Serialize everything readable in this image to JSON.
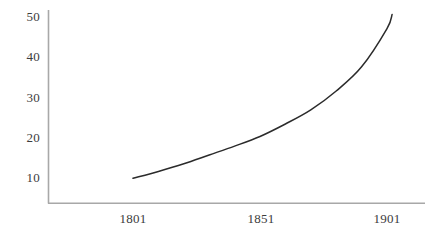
{
  "chart_data": {
    "type": "line",
    "title": "",
    "subtitle": "",
    "xlabel": "",
    "ylabel": "",
    "xlim": [
      1781,
      1920
    ],
    "ylim": [
      0,
      54
    ],
    "grid": false,
    "legend": null,
    "x_ticks": [
      "1801",
      "1851",
      "1901"
    ],
    "x_tick_values": [
      1801,
      1851,
      1901
    ],
    "y_ticks": [
      "10",
      "20",
      "30",
      "40",
      "50"
    ],
    "y_tick_values": [
      10,
      20,
      30,
      40,
      50
    ],
    "series": [
      {
        "name": "",
        "color": "#2b2b2b",
        "x": [
          1801,
          1811,
          1821,
          1831,
          1841,
          1851,
          1861,
          1871,
          1881,
          1891,
          1901,
          1903
        ],
        "values": [
          9.8,
          11.5,
          13.4,
          15.6,
          17.8,
          20.2,
          23.3,
          26.8,
          31.5,
          37.5,
          47.0,
          50.5
        ]
      }
    ],
    "axis_color": "#a8a8a8",
    "background": "#ffffff"
  },
  "axes": {
    "y_axis_name": "value-axis",
    "x_axis_name": "year-axis"
  }
}
